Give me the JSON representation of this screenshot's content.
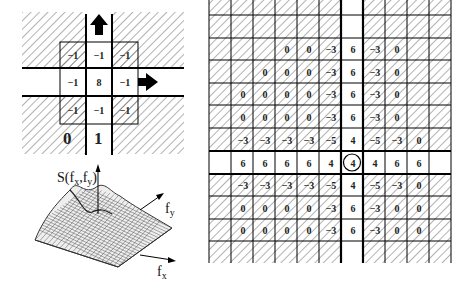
{
  "left_diagram": {
    "kernel_grid": [
      [
        "−1",
        "−1",
        "−1"
      ],
      [
        "−1",
        "8",
        "−1"
      ],
      [
        "−1",
        "−1",
        "−1"
      ]
    ],
    "kernel_hatched": [
      [
        true,
        false,
        true
      ],
      [
        false,
        false,
        false
      ],
      [
        true,
        false,
        true
      ]
    ],
    "region_labels": {
      "left": "0",
      "right": "1"
    },
    "arrows": [
      "up-arrow",
      "right-arrow"
    ]
  },
  "surface_plot": {
    "z_label": "S(f",
    "z_label_sub1": "x",
    "z_label_mid": ",f",
    "z_label_sub2": "y",
    "z_label_end": ")",
    "x_axis": "f",
    "x_axis_sub": "x",
    "y_axis": "f",
    "y_axis_sub": "y"
  },
  "right_grid": {
    "rows": [
      [
        "",
        "",
        "",
        "",
        "",
        "",
        "",
        "",
        "",
        "",
        ""
      ],
      [
        "",
        "",
        "",
        "0",
        "0",
        "−3",
        "6",
        "−3",
        "0",
        "",
        ""
      ],
      [
        "",
        "",
        "0",
        "0",
        "0",
        "−3",
        "6",
        "−3",
        "0",
        "",
        ""
      ],
      [
        "",
        "0",
        "0",
        "0",
        "0",
        "−3",
        "6",
        "−3",
        "0",
        "",
        ""
      ],
      [
        "",
        "0",
        "0",
        "0",
        "0",
        "−3",
        "6",
        "−3",
        "0",
        "",
        ""
      ],
      [
        "",
        "−3",
        "−3",
        "−3",
        "−3",
        "−5",
        "4",
        "−5",
        "−3",
        "0",
        ""
      ],
      [
        "",
        "6",
        "6",
        "6",
        "6",
        "4",
        "4",
        "4",
        "6",
        "6",
        ""
      ],
      [
        "",
        "−3",
        "−3",
        "−3",
        "−3",
        "−5",
        "4",
        "−5",
        "−3",
        "0",
        ""
      ],
      [
        "",
        "0",
        "0",
        "0",
        "0",
        "−3",
        "6",
        "−3",
        "0",
        "0",
        ""
      ],
      [
        "",
        "0",
        "0",
        "0",
        "0",
        "−3",
        "6",
        "−3",
        "0",
        "0",
        ""
      ],
      [
        "",
        "",
        "",
        "",
        "",
        "",
        "",
        "",
        "",
        "",
        ""
      ]
    ],
    "circled_cell": {
      "row": 6,
      "col": 6,
      "value": "4"
    }
  }
}
